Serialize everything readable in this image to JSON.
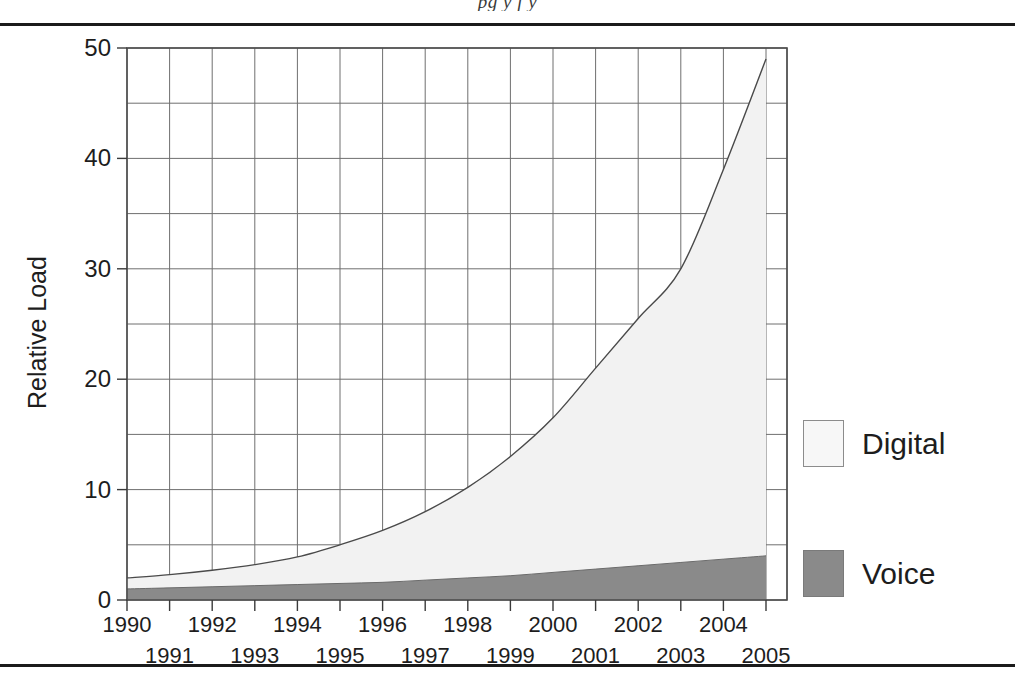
{
  "page": {
    "running_head": "pg y f y",
    "rule_color": "#1b1b1b"
  },
  "chart_data": {
    "type": "area",
    "stacked": true,
    "title": "",
    "xlabel": "",
    "ylabel": "Relative Load",
    "xlim": [
      1990,
      2005
    ],
    "ylim": [
      0,
      50
    ],
    "ytick_values": [
      0,
      10,
      20,
      30,
      40,
      50
    ],
    "ytick_labels": [
      "0",
      "10",
      "20",
      "30",
      "40",
      "50"
    ],
    "y_minor_gridline_step": 5,
    "grid": true,
    "legend_position": "right",
    "categories": [
      1990,
      1991,
      1992,
      1993,
      1994,
      1995,
      1996,
      1997,
      1998,
      1999,
      2000,
      2001,
      2002,
      2003,
      2004,
      2005
    ],
    "xtick_labels": [
      "1990",
      "1991",
      "1992",
      "1993",
      "1994",
      "1995",
      "1996",
      "1997",
      "1998",
      "1999",
      "2000",
      "2001",
      "2002",
      "2003",
      "2004",
      "2005"
    ],
    "series": [
      {
        "name": "Voice",
        "color": "#8a8a8a",
        "values": [
          1.0,
          1.1,
          1.2,
          1.3,
          1.4,
          1.5,
          1.6,
          1.8,
          2.0,
          2.2,
          2.5,
          2.8,
          3.1,
          3.4,
          3.7,
          4.0
        ]
      },
      {
        "name": "Digital",
        "color": "#f2f2f2",
        "note": "values are the stacked top of the combined Voice + Digital band",
        "total_top": [
          2.0,
          2.3,
          2.7,
          3.2,
          3.9,
          5.0,
          6.3,
          8.0,
          10.2,
          13.0,
          16.5,
          21.0,
          25.5,
          30.0,
          39.0,
          49.0
        ]
      }
    ],
    "legend": [
      {
        "label": "Digital",
        "color": "#f7f7f7",
        "border": "#8c8c8c"
      },
      {
        "label": "Voice",
        "color": "#8a8a8a",
        "border": "#7a7a7a"
      }
    ]
  },
  "axis": {
    "y_title": "Relative Load"
  }
}
